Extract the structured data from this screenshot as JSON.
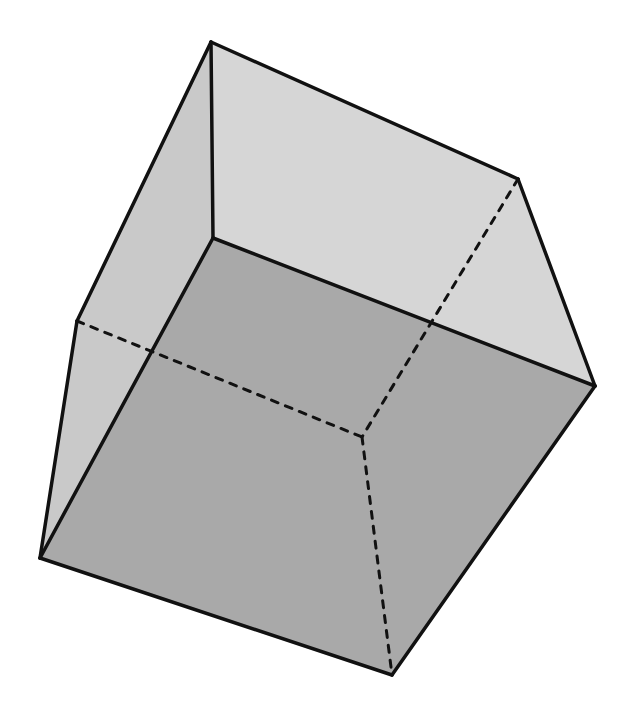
{
  "figure": {
    "width": 642,
    "height": 714
  },
  "vertices": {
    "top": [
      211,
      42
    ],
    "upper_right": [
      518,
      179
    ],
    "right": [
      595,
      386
    ],
    "inner_front": [
      213,
      238
    ],
    "left": [
      77,
      321
    ],
    "bottom_left": [
      40,
      558
    ],
    "bottom": [
      392,
      675
    ],
    "hidden": [
      362,
      437
    ]
  },
  "faces": [
    {
      "name": "top-face",
      "points": [
        "top",
        "upper_right",
        "right",
        "inner_front"
      ],
      "fill": "#d6d6d6"
    },
    {
      "name": "left-face",
      "points": [
        "top",
        "inner_front",
        "bottom_left",
        "left"
      ],
      "fill": "#c9c9c9"
    },
    {
      "name": "front-face",
      "points": [
        "inner_front",
        "right",
        "bottom",
        "bottom_left"
      ],
      "fill": "#a9a9a9"
    }
  ],
  "solid_edges": [
    [
      "top",
      "upper_right"
    ],
    [
      "top",
      "inner_front"
    ],
    [
      "top",
      "left"
    ],
    [
      "upper_right",
      "right"
    ],
    [
      "inner_front",
      "right"
    ],
    [
      "inner_front",
      "bottom_left"
    ],
    [
      "left",
      "bottom_left"
    ],
    [
      "right",
      "bottom"
    ],
    [
      "bottom_left",
      "bottom"
    ]
  ],
  "dashed_edges": [
    [
      "left",
      "hidden"
    ],
    [
      "upper_right",
      "hidden"
    ],
    [
      "hidden",
      "bottom"
    ]
  ],
  "colors": {
    "edge": "#111111",
    "background": "#ffffff"
  }
}
